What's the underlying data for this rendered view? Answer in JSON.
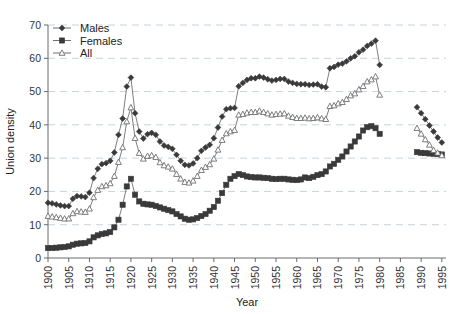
{
  "chart_data": {
    "type": "line",
    "title": "",
    "xlabel": "Year",
    "ylabel": "Union density",
    "xlim": [
      1900,
      1996
    ],
    "ylim": [
      0,
      70
    ],
    "grid": true,
    "legend_position": "top-left",
    "xticks": [
      1900,
      1905,
      1910,
      1915,
      1920,
      1925,
      1930,
      1935,
      1940,
      1945,
      1950,
      1955,
      1960,
      1965,
      1970,
      1975,
      1980,
      1985,
      1990,
      1995
    ],
    "yticks": [
      0,
      10,
      20,
      30,
      40,
      50,
      60,
      70
    ],
    "marker_color": "#3a3a3a",
    "line_color": "#6f6f6f",
    "grid_color": "#c9d2dd",
    "series": [
      {
        "name": "Males",
        "marker": "diamond",
        "x": [
          1900,
          1901,
          1902,
          1903,
          1904,
          1905,
          1906,
          1907,
          1908,
          1909,
          1910,
          1911,
          1912,
          1913,
          1914,
          1915,
          1916,
          1917,
          1918,
          1919,
          1920,
          1921,
          1922,
          1923,
          1924,
          1925,
          1926,
          1927,
          1928,
          1929,
          1930,
          1931,
          1932,
          1933,
          1934,
          1935,
          1936,
          1937,
          1938,
          1939,
          1940,
          1941,
          1942,
          1943,
          1944,
          1945,
          1946,
          1947,
          1948,
          1949,
          1950,
          1951,
          1952,
          1953,
          1954,
          1955,
          1956,
          1957,
          1958,
          1959,
          1960,
          1961,
          1962,
          1963,
          1964,
          1965,
          1966,
          1967,
          1968,
          1969,
          1970,
          1971,
          1972,
          1973,
          1974,
          1975,
          1976,
          1977,
          1978,
          1979,
          1980,
          1989,
          1990,
          1991,
          1992,
          1993,
          1994,
          1995
        ],
        "y": [
          16.6,
          16.4,
          16.1,
          15.8,
          15.6,
          15.6,
          17.8,
          18.6,
          18.5,
          18.3,
          19.6,
          24.0,
          26.8,
          28.2,
          28.5,
          29.2,
          31.7,
          37.0,
          41.9,
          51.5,
          54.2,
          43.5,
          38.0,
          35.9,
          37.2,
          37.6,
          37.0,
          35.0,
          33.8,
          33.4,
          32.8,
          31.0,
          29.2,
          28.0,
          27.8,
          28.4,
          30.0,
          32.2,
          33.2,
          34.0,
          36.0,
          39.2,
          42.5,
          44.7,
          45.0,
          45.1,
          51.6,
          52.6,
          53.5,
          54.0,
          54.0,
          54.5,
          54.2,
          53.7,
          53.3,
          53.5,
          53.8,
          53.8,
          53.0,
          52.6,
          52.3,
          52.2,
          52.2,
          52.0,
          52.1,
          52.2,
          51.5,
          51.3,
          57.0,
          57.4,
          58.1,
          58.4,
          59.1,
          60.0,
          60.6,
          61.8,
          62.6,
          63.7,
          64.4,
          65.3,
          58.0,
          45.3,
          43.5,
          41.7,
          39.8,
          38.0,
          36.2,
          34.7
        ]
      },
      {
        "name": "Females",
        "marker": "square",
        "x": [
          1900,
          1901,
          1902,
          1903,
          1904,
          1905,
          1906,
          1907,
          1908,
          1909,
          1910,
          1911,
          1912,
          1913,
          1914,
          1915,
          1916,
          1917,
          1918,
          1919,
          1920,
          1921,
          1922,
          1923,
          1924,
          1925,
          1926,
          1927,
          1928,
          1929,
          1930,
          1931,
          1932,
          1933,
          1934,
          1935,
          1936,
          1937,
          1938,
          1939,
          1940,
          1941,
          1942,
          1943,
          1944,
          1945,
          1946,
          1947,
          1948,
          1949,
          1950,
          1951,
          1952,
          1953,
          1954,
          1955,
          1956,
          1957,
          1958,
          1959,
          1960,
          1961,
          1962,
          1963,
          1964,
          1965,
          1966,
          1967,
          1968,
          1969,
          1970,
          1971,
          1972,
          1973,
          1974,
          1975,
          1976,
          1977,
          1978,
          1979,
          1980,
          1989,
          1990,
          1991,
          1992,
          1993,
          1994,
          1995
        ],
        "y": [
          3.0,
          3.0,
          3.1,
          3.2,
          3.3,
          3.5,
          4.0,
          4.3,
          4.4,
          4.5,
          5.0,
          6.2,
          6.8,
          7.2,
          7.4,
          7.8,
          9.2,
          11.5,
          16.0,
          21.5,
          23.8,
          19.0,
          17.0,
          16.3,
          16.1,
          16.0,
          15.6,
          15.2,
          14.8,
          14.4,
          14.0,
          13.2,
          12.5,
          11.8,
          11.5,
          11.6,
          12.0,
          12.6,
          13.2,
          14.2,
          15.3,
          17.2,
          19.5,
          22.0,
          23.8,
          24.6,
          25.2,
          24.9,
          24.5,
          24.3,
          24.2,
          24.2,
          24.1,
          24.0,
          23.8,
          23.7,
          23.8,
          23.8,
          23.6,
          23.5,
          23.4,
          23.6,
          24.2,
          24.0,
          24.4,
          24.9,
          25.2,
          26.0,
          27.5,
          28.3,
          29.5,
          30.5,
          32.0,
          33.5,
          35.0,
          36.5,
          38.3,
          39.3,
          39.6,
          39.0,
          37.3,
          31.8,
          31.6,
          31.5,
          31.4,
          31.3,
          31.2,
          31.1
        ]
      },
      {
        "name": "All",
        "marker": "triangle",
        "x": [
          1900,
          1901,
          1902,
          1903,
          1904,
          1905,
          1906,
          1907,
          1908,
          1909,
          1910,
          1911,
          1912,
          1913,
          1914,
          1915,
          1916,
          1917,
          1918,
          1919,
          1920,
          1921,
          1922,
          1923,
          1924,
          1925,
          1926,
          1927,
          1928,
          1929,
          1930,
          1931,
          1932,
          1933,
          1934,
          1935,
          1936,
          1937,
          1938,
          1939,
          1940,
          1941,
          1942,
          1943,
          1944,
          1945,
          1946,
          1947,
          1948,
          1949,
          1950,
          1951,
          1952,
          1953,
          1954,
          1955,
          1956,
          1957,
          1958,
          1959,
          1960,
          1961,
          1962,
          1963,
          1964,
          1965,
          1966,
          1967,
          1968,
          1969,
          1970,
          1971,
          1972,
          1973,
          1974,
          1975,
          1976,
          1977,
          1978,
          1979,
          1980,
          1989,
          1990,
          1991,
          1992,
          1993,
          1994,
          1995
        ],
        "y": [
          12.6,
          12.4,
          12.2,
          12.0,
          11.8,
          11.8,
          13.4,
          14.0,
          13.9,
          13.8,
          14.8,
          18.2,
          20.4,
          21.5,
          21.8,
          22.4,
          24.6,
          28.8,
          33.2,
          41.0,
          45.2,
          36.0,
          31.5,
          29.8,
          30.6,
          30.8,
          30.3,
          28.7,
          27.8,
          27.4,
          26.8,
          25.2,
          23.8,
          22.8,
          22.6,
          23.2,
          24.6,
          26.4,
          27.3,
          28.1,
          29.8,
          32.5,
          35.4,
          37.4,
          38.0,
          38.4,
          43.0,
          43.2,
          43.6,
          43.8,
          43.8,
          44.2,
          43.8,
          43.4,
          43.0,
          43.2,
          43.3,
          43.4,
          42.7,
          42.3,
          42.0,
          42.0,
          42.1,
          41.9,
          42.0,
          42.2,
          41.9,
          41.7,
          45.6,
          45.8,
          46.4,
          46.8,
          47.7,
          48.8,
          49.4,
          50.6,
          51.6,
          53.0,
          53.6,
          54.5,
          49.0,
          39.0,
          37.3,
          35.6,
          34.0,
          32.4,
          31.6,
          30.8
        ]
      }
    ]
  },
  "legend": {
    "items": [
      {
        "label": "Males"
      },
      {
        "label": "Females"
      },
      {
        "label": "All"
      }
    ]
  }
}
